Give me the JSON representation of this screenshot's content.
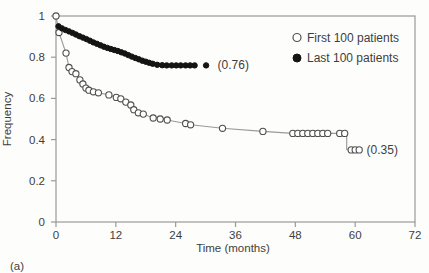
{
  "figure": {
    "panel_label": "(a)",
    "background": "#fdfdfc"
  },
  "colors": {
    "frame": "#9a9a9a",
    "text": "#3d3d3d",
    "open_marker_stroke": "#4f4f4f",
    "open_line": "#999999",
    "filled_marker": "#141414"
  },
  "chart_data": {
    "type": "line",
    "subtype": "kaplan-meier-survival",
    "title": "",
    "xlabel": "Time (months)",
    "ylabel": "Frequency",
    "xlim": [
      0,
      72
    ],
    "ylim": [
      0,
      1
    ],
    "x_ticks": [
      0,
      12,
      24,
      36,
      48,
      60,
      72
    ],
    "y_ticks": [
      0,
      0.2,
      0.4,
      0.6,
      0.8,
      1
    ],
    "y_tick_labels": [
      "0",
      "0.2",
      "0.4",
      "0.6",
      "0.8",
      "1"
    ],
    "grid": false,
    "legend_position": "upper right",
    "series": [
      {
        "name": "First 100 patients",
        "marker": "open",
        "color": "#4f4f4f",
        "line_color": "#999999",
        "final_value": 0.35,
        "annotation": {
          "text": "(0.35)",
          "t": 62.3,
          "f": 0.35
        },
        "points": [
          [
            0,
            1.0
          ],
          [
            0.6,
            0.92
          ],
          [
            2.0,
            0.82
          ],
          [
            2.6,
            0.75
          ],
          [
            3.2,
            0.73
          ],
          [
            4.0,
            0.72
          ],
          [
            4.8,
            0.69
          ],
          [
            5.4,
            0.67
          ],
          [
            6.0,
            0.65
          ],
          [
            6.6,
            0.64
          ],
          [
            7.5,
            0.632
          ],
          [
            8.5,
            0.627
          ],
          [
            10.6,
            0.617
          ],
          [
            12.1,
            0.605
          ],
          [
            13.0,
            0.598
          ],
          [
            14.0,
            0.582
          ],
          [
            15.0,
            0.568
          ],
          [
            15.6,
            0.545
          ],
          [
            16.5,
            0.53
          ],
          [
            17.5,
            0.524
          ],
          [
            19.5,
            0.505
          ],
          [
            20.9,
            0.5
          ],
          [
            22.3,
            0.495
          ],
          [
            26.0,
            0.478
          ],
          [
            27.0,
            0.472
          ],
          [
            33.4,
            0.455
          ],
          [
            41.5,
            0.44
          ],
          [
            47.5,
            0.43
          ],
          [
            48.5,
            0.43
          ],
          [
            49.5,
            0.43
          ],
          [
            50.5,
            0.43
          ],
          [
            51.5,
            0.43
          ],
          [
            52.5,
            0.43
          ],
          [
            53.5,
            0.43
          ],
          [
            54.5,
            0.43
          ],
          [
            56.9,
            0.43
          ],
          [
            57.9,
            0.43
          ],
          [
            59.2,
            0.35
          ],
          [
            60.0,
            0.35
          ],
          [
            60.8,
            0.35
          ]
        ],
        "path_extra": [
          [
            58.3,
            0.43
          ],
          [
            58.3,
            0.352
          ]
        ],
        "isolated_points": []
      },
      {
        "name": "Last 100 patients",
        "marker": "filled",
        "color": "#141414",
        "line_color": "#141414",
        "final_value": 0.76,
        "annotation": {
          "text": "(0.76)",
          "t": 32.4,
          "f": 0.76
        },
        "points": [
          [
            0.5,
            0.95
          ],
          [
            1.2,
            0.94
          ],
          [
            1.9,
            0.932
          ],
          [
            2.6,
            0.925
          ],
          [
            3.3,
            0.918
          ],
          [
            4.0,
            0.91
          ],
          [
            4.7,
            0.902
          ],
          [
            5.4,
            0.895
          ],
          [
            6.1,
            0.888
          ],
          [
            6.8,
            0.88
          ],
          [
            7.5,
            0.872
          ],
          [
            8.2,
            0.865
          ],
          [
            8.9,
            0.858
          ],
          [
            9.6,
            0.851
          ],
          [
            10.3,
            0.845
          ],
          [
            11.0,
            0.84
          ],
          [
            11.7,
            0.835
          ],
          [
            12.4,
            0.83
          ],
          [
            13.1,
            0.824
          ],
          [
            13.8,
            0.818
          ],
          [
            14.5,
            0.81
          ],
          [
            15.2,
            0.803
          ],
          [
            15.9,
            0.796
          ],
          [
            16.6,
            0.79
          ],
          [
            17.3,
            0.783
          ],
          [
            18.0,
            0.778
          ],
          [
            18.7,
            0.773
          ],
          [
            19.4,
            0.768
          ],
          [
            20.3,
            0.763
          ],
          [
            21.3,
            0.761
          ],
          [
            22.2,
            0.76
          ],
          [
            23.2,
            0.76
          ],
          [
            24.1,
            0.76
          ],
          [
            25.0,
            0.76
          ],
          [
            26.0,
            0.76
          ],
          [
            26.9,
            0.76
          ],
          [
            27.8,
            0.76
          ]
        ],
        "path_extra": [],
        "isolated_points": [
          [
            30.1,
            0.76
          ]
        ]
      }
    ]
  }
}
